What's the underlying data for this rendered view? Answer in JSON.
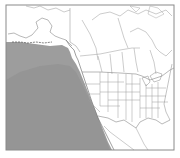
{
  "map": {
    "type": "choropleth-outline",
    "region": "North America (western focus)",
    "frame": {
      "x": 6,
      "y": 5,
      "width": 168,
      "height": 145,
      "border_color": "#8a8a8a"
    },
    "colors": {
      "land": "#ffffff",
      "ocean_unshaded": "#ffffff",
      "shaded_area": "#9b9b9b",
      "shaded_area_dark": "#8f8f8f",
      "boundary": "#888888"
    },
    "layers": [
      {
        "name": "shaded-pacific-region",
        "description": "Shaded grey area over the northeast Pacific Ocean, off the west coast of North America"
      },
      {
        "name": "coastlines",
        "description": "Coastlines of Alaska, Canada, United States and Mexico"
      },
      {
        "name": "state-province-boundaries",
        "description": "US state and Canadian province boundary lines"
      }
    ]
  }
}
